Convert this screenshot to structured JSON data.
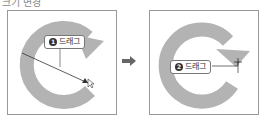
{
  "heading": "크기 변경",
  "steps": [
    {
      "number": "1",
      "label": "드래그"
    },
    {
      "number": "2",
      "label": "드래그"
    }
  ],
  "colors": {
    "shape": "#b3b3b3",
    "frame": "#999999",
    "line": "#333333"
  },
  "icons": {
    "between": "right-arrow-icon",
    "cursor": "cursor-icon"
  }
}
